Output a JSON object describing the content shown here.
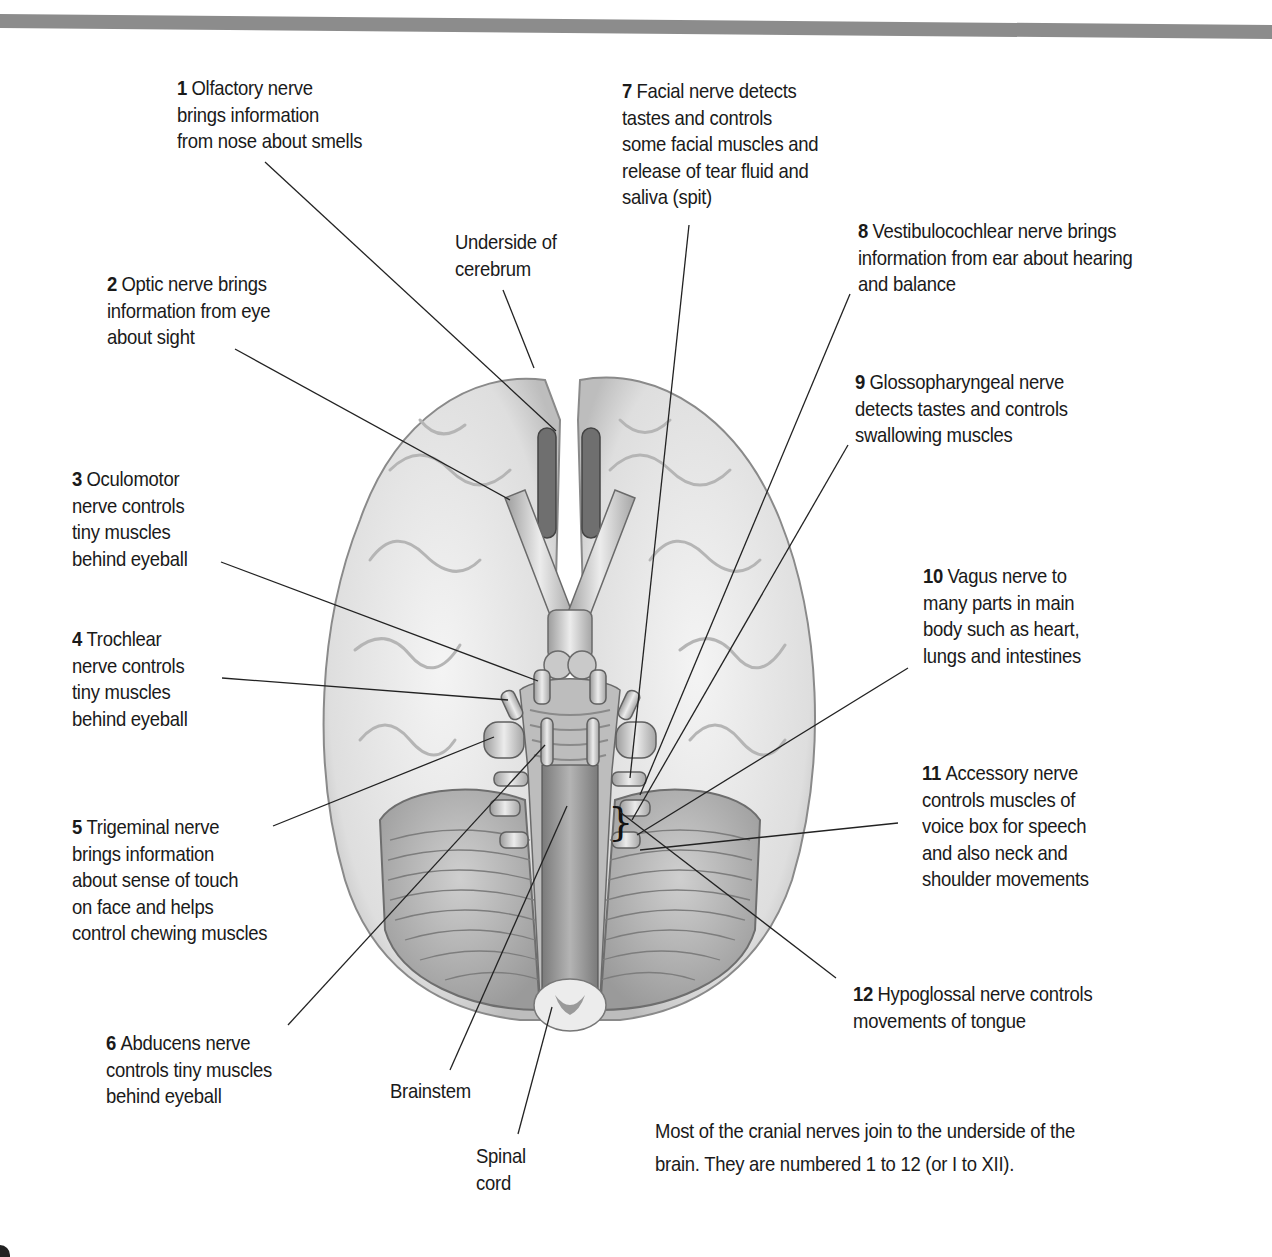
{
  "figure": {
    "top_rule_color": "#8c8c8c",
    "structures": [
      {
        "id": "cerebrum",
        "lines": [
          "Underside of",
          "cerebrum"
        ]
      },
      {
        "id": "brainstem",
        "lines": [
          "Brainstem"
        ]
      },
      {
        "id": "spinal-cord",
        "lines": [
          "Spinal",
          "cord"
        ]
      }
    ],
    "nerves": [
      {
        "number": "1",
        "first": "Olfactory nerve",
        "lines": [
          "brings information",
          "from nose about smells"
        ]
      },
      {
        "number": "2",
        "first": "Optic nerve brings",
        "lines": [
          "information from eye",
          "about sight"
        ]
      },
      {
        "number": "3",
        "first": "Oculomotor",
        "lines": [
          "nerve controls",
          "tiny muscles",
          "behind eyeball"
        ]
      },
      {
        "number": "4",
        "first": "Trochlear",
        "lines": [
          "nerve controls",
          "tiny muscles",
          "behind eyeball"
        ]
      },
      {
        "number": "5",
        "first": "Trigeminal nerve",
        "lines": [
          "brings information",
          "about sense of touch",
          "on face and helps",
          "control chewing muscles"
        ]
      },
      {
        "number": "6",
        "first": "Abducens nerve",
        "lines": [
          "controls tiny muscles",
          "behind eyeball"
        ]
      },
      {
        "number": "7",
        "first": "Facial nerve detects",
        "lines": [
          "tastes and controls",
          "some facial muscles and",
          "release of tear fluid and",
          "saliva (spit)"
        ]
      },
      {
        "number": "8",
        "first": "Vestibulocochlear nerve brings",
        "lines": [
          "information from ear about hearing",
          "and balance"
        ]
      },
      {
        "number": "9",
        "first": "Glossopharyngeal nerve",
        "lines": [
          "detects tastes and controls",
          "swallowing muscles"
        ]
      },
      {
        "number": "10",
        "first": "Vagus nerve to",
        "lines": [
          "many parts in main",
          "body such as heart,",
          "lungs and intestines"
        ]
      },
      {
        "number": "11",
        "first": "Accessory nerve",
        "lines": [
          "controls muscles of",
          "voice box for speech",
          "and also neck and",
          "shoulder movements"
        ]
      },
      {
        "number": "12",
        "first": "Hypoglossal nerve controls",
        "lines": [
          "movements of tongue"
        ]
      }
    ],
    "caption": {
      "lines": [
        "Most of the cranial nerves join to the underside of the",
        "brain. They are numbered 1 to 12 (or I to XII)."
      ]
    }
  }
}
